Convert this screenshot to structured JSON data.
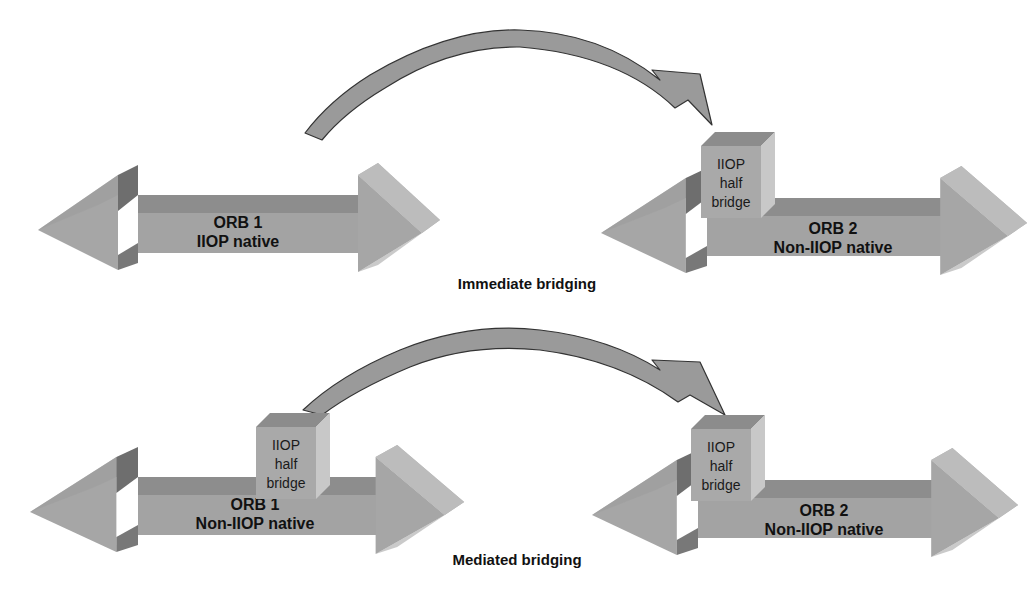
{
  "diagram": {
    "colors": {
      "background": "#ffffff",
      "arrow_front": "#a3a3a3",
      "arrow_top": "#8a8a8a",
      "arrow_head_light": "#b4b4b4",
      "arrow_head_dark": "#7c7c7c",
      "box_front": "#a8a8a8",
      "box_top": "#8c8c8c",
      "box_side": "#c6c6c6",
      "curve_fill": "#9a9a9a",
      "curve_stroke": "#333333",
      "text": "#111111"
    },
    "sections": [
      {
        "caption": "Immediate bridging",
        "orb_left": {
          "line1": "ORB 1",
          "line2": "IIOP native",
          "has_half_bridge": false
        },
        "orb_right": {
          "line1": "ORB 2",
          "line2": "Non-IIOP native",
          "has_half_bridge": true,
          "half_bridge": {
            "line1": "IIOP",
            "line2": "half",
            "line3": "bridge"
          }
        },
        "connector": {
          "from": "orb_left",
          "to": "orb_right_half_bridge"
        }
      },
      {
        "caption": "Mediated bridging",
        "orb_left": {
          "line1": "ORB 1",
          "line2": "Non-IIOP native",
          "has_half_bridge": true,
          "half_bridge": {
            "line1": "IIOP",
            "line2": "half",
            "line3": "bridge"
          }
        },
        "orb_right": {
          "line1": "ORB 2",
          "line2": "Non-IIOP native",
          "has_half_bridge": true,
          "half_bridge": {
            "line1": "IIOP",
            "line2": "half",
            "line3": "bridge"
          }
        },
        "connector": {
          "from": "orb_left_half_bridge",
          "to": "orb_right_half_bridge"
        }
      }
    ]
  }
}
